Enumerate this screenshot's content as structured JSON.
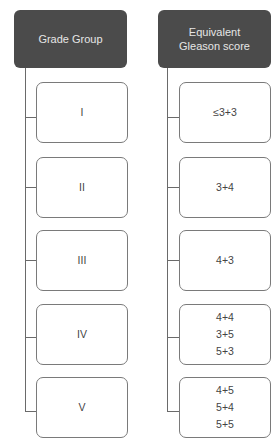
{
  "columns": [
    {
      "header": [
        "Grade Group"
      ],
      "items": [
        {
          "lines": [
            "I"
          ]
        },
        {
          "lines": [
            "II"
          ]
        },
        {
          "lines": [
            "III"
          ]
        },
        {
          "lines": [
            "IV"
          ]
        },
        {
          "lines": [
            "V"
          ]
        }
      ]
    },
    {
      "header": [
        "Equivalent",
        "Gleason score"
      ],
      "items": [
        {
          "lines": [
            "≤3+3"
          ]
        },
        {
          "lines": [
            "3+4"
          ]
        },
        {
          "lines": [
            "4+3"
          ]
        },
        {
          "lines": [
            "4+4",
            "3+5",
            "5+3"
          ]
        },
        {
          "lines": [
            "4+5",
            "5+4",
            "5+5"
          ]
        }
      ]
    }
  ],
  "colors": {
    "header_bg": "#4b4b4b",
    "header_text": "#e6e6e6",
    "box_border": "#7a7a7a",
    "connector": "#6a6a6a"
  }
}
